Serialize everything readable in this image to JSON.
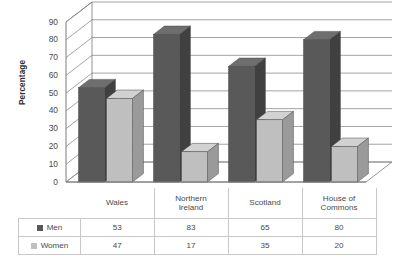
{
  "chart_data": {
    "type": "bar",
    "title": "",
    "subtitle": "",
    "xlabel": "",
    "ylabel": "Percentage",
    "ylim": [
      0,
      90
    ],
    "ytick_step": 10,
    "yticks": [
      90,
      80,
      70,
      60,
      50,
      40,
      30,
      20,
      10,
      0
    ],
    "grid": true,
    "three_d": true,
    "legend_position": "data-table",
    "categories": [
      "Wales",
      "Northern Ireland",
      "Scotland",
      "House of Commons"
    ],
    "category_lines": [
      [
        "Wales"
      ],
      [
        "Northern",
        "Ireland"
      ],
      [
        "Scotland"
      ],
      [
        "House of",
        "Commons"
      ]
    ],
    "series": [
      {
        "name": "Men",
        "values": [
          53,
          83,
          65,
          80
        ],
        "color": "#595959"
      },
      {
        "name": "Women",
        "values": [
          47,
          17,
          35,
          20
        ],
        "color": "#bfbfbf"
      }
    ]
  },
  "table": {
    "rows": [
      {
        "label": "Men",
        "swatch": "men-swatch",
        "values": [
          "53",
          "83",
          "65",
          "80"
        ]
      },
      {
        "label": "Women",
        "swatch": "women-swatch",
        "values": [
          "47",
          "17",
          "35",
          "20"
        ]
      }
    ]
  },
  "colors": {
    "men_front": "#595959",
    "men_side": "#404040",
    "men_top": "#6e6e6e",
    "women_front": "#bfbfbf",
    "women_side": "#9a9a9a",
    "women_top": "#d2d2d2",
    "gridline": "#8c8c8c",
    "axis": "#7a7a7a",
    "table_border": "#c8c8c8",
    "text": "#4a4a4a"
  }
}
